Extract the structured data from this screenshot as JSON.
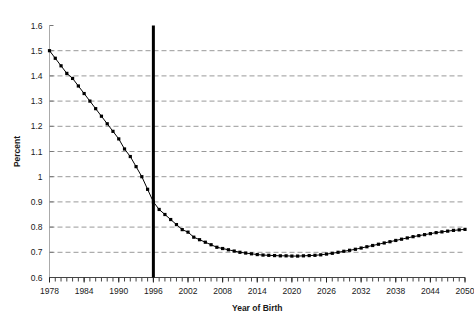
{
  "chart_data": {
    "type": "line",
    "title": "",
    "xlabel": "Year of Birth",
    "ylabel": "Percent",
    "xlim": [
      1978,
      2050
    ],
    "ylim": [
      0.6,
      1.6
    ],
    "grid": true,
    "legend": null,
    "y_ticks": [
      0.6,
      0.7,
      0.8,
      0.9,
      1.0,
      1.1,
      1.2,
      1.3,
      1.4,
      1.5,
      1.6
    ],
    "y_tick_labels": [
      "0.6",
      "0.7",
      "0.8",
      "0.9",
      "1",
      "1.1",
      "1.2",
      "1.3",
      "1.4",
      "1.5",
      "1.6"
    ],
    "x_ticks": [
      1978,
      1984,
      1990,
      1996,
      2002,
      2008,
      2014,
      2020,
      2026,
      2032,
      2038,
      2044,
      2050
    ],
    "x_tick_labels": [
      "1978",
      "1984",
      "1990",
      "1996",
      "2002",
      "2008",
      "2014",
      "2020",
      "2026",
      "2032",
      "2038",
      "2044",
      "2050"
    ],
    "x_minor_tick_step": 1,
    "series_color": "#000000",
    "grid_color": "#999999",
    "axis_color": "#aaaaaa",
    "marker": "square",
    "annotations": [
      {
        "name": "vertical-rule-1996",
        "type": "vline",
        "x": 1996,
        "color": "#000000",
        "width_px": 3
      }
    ],
    "x": [
      1978,
      1979,
      1980,
      1981,
      1982,
      1983,
      1984,
      1985,
      1986,
      1987,
      1988,
      1989,
      1990,
      1991,
      1992,
      1993,
      1994,
      1995,
      1996,
      1997,
      1998,
      1999,
      2000,
      2001,
      2002,
      2003,
      2004,
      2005,
      2006,
      2007,
      2008,
      2009,
      2010,
      2011,
      2012,
      2013,
      2014,
      2015,
      2016,
      2017,
      2018,
      2019,
      2020,
      2021,
      2022,
      2023,
      2024,
      2025,
      2026,
      2027,
      2028,
      2029,
      2030,
      2031,
      2032,
      2033,
      2034,
      2035,
      2036,
      2037,
      2038,
      2039,
      2040,
      2041,
      2042,
      2043,
      2044,
      2045,
      2046,
      2047,
      2048,
      2049,
      2050
    ],
    "y": [
      1.5,
      1.47,
      1.44,
      1.41,
      1.39,
      1.36,
      1.33,
      1.3,
      1.27,
      1.24,
      1.21,
      1.18,
      1.15,
      1.11,
      1.08,
      1.04,
      1.0,
      0.95,
      0.9,
      0.87,
      0.85,
      0.83,
      0.81,
      0.79,
      0.78,
      0.76,
      0.75,
      0.74,
      0.73,
      0.72,
      0.715,
      0.71,
      0.705,
      0.7,
      0.697,
      0.694,
      0.691,
      0.689,
      0.688,
      0.687,
      0.686,
      0.686,
      0.685,
      0.685,
      0.686,
      0.687,
      0.688,
      0.69,
      0.693,
      0.696,
      0.7,
      0.704,
      0.708,
      0.712,
      0.717,
      0.722,
      0.727,
      0.732,
      0.737,
      0.742,
      0.747,
      0.752,
      0.757,
      0.762,
      0.766,
      0.77,
      0.774,
      0.778,
      0.781,
      0.784,
      0.787,
      0.789,
      0.791
    ]
  }
}
